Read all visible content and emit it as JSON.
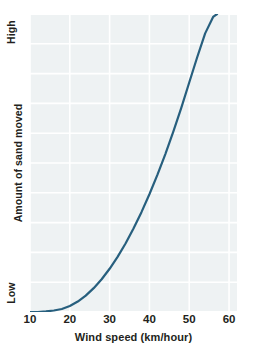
{
  "chart_data": {
    "type": "line",
    "title": "",
    "xlabel": "Wind speed (km/hour)",
    "ylabel": "Amount of sand moved",
    "xlim": [
      10,
      62
    ],
    "ylim": [
      0,
      1
    ],
    "xticks": [
      "10",
      "20",
      "30",
      "40",
      "50",
      "60"
    ],
    "xtick_values": [
      10,
      20,
      30,
      40,
      50,
      60
    ],
    "yticks": [
      "Low",
      "High"
    ],
    "ytick_positions": [
      "bottom",
      "top"
    ],
    "grid": "on",
    "grid_color": "#ffffff",
    "plot_background": "#eef2f3",
    "legend": "none",
    "series": [
      {
        "name": "Sand transport vs wind speed",
        "color": "#275f7e",
        "line_width": 2.2,
        "x": [
          10,
          12,
          14,
          16,
          18,
          20,
          22,
          24,
          26,
          28,
          30,
          32,
          34,
          36,
          38,
          40,
          42,
          44,
          46,
          48,
          50,
          52,
          54,
          56,
          57
        ],
        "y": [
          0.0,
          0.0,
          0.002,
          0.005,
          0.01,
          0.02,
          0.035,
          0.055,
          0.08,
          0.11,
          0.145,
          0.185,
          0.23,
          0.28,
          0.335,
          0.395,
          0.46,
          0.53,
          0.605,
          0.685,
          0.77,
          0.855,
          0.935,
          0.99,
          1.0
        ]
      }
    ],
    "annotation": "Amount of sand moved rises sharply, non-linearly, with wind speed above about 20 km/hour."
  },
  "axes": {
    "y_top_label": "High",
    "y_bottom_label": "Low",
    "y_title": "Amount of sand moved",
    "x_title": "Wind speed (km/hour)",
    "x_tick_labels": [
      "10",
      "20",
      "30",
      "40",
      "50",
      "60"
    ]
  },
  "colors": {
    "curve": "#275f7e",
    "plot_bg": "#eef2f3",
    "grid": "#ffffff",
    "text": "#231f20",
    "page_bg": "#ffffff"
  }
}
